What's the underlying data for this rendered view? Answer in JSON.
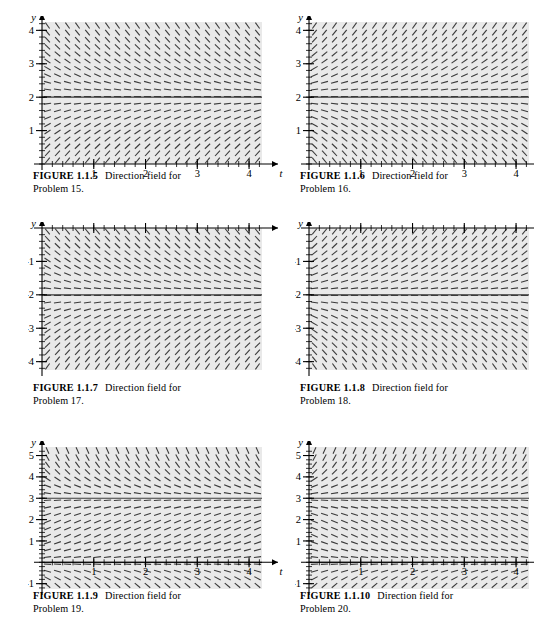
{
  "page": {
    "background_color": "#ffffff",
    "panel_color": "#e9e9e9",
    "ink_color": "#3a3a3a",
    "axis_color": "#000000"
  },
  "figures": [
    {
      "id": "figure-1-1-5",
      "label": "FIGURE 1.1.5",
      "description": "Direction field for",
      "caption_line2": "Problem 15.",
      "axis": {
        "x_label": "t",
        "y_label": "y",
        "x_ticks": [
          "1",
          "2",
          "3",
          "4"
        ],
        "y_ticks": [
          "1",
          "2",
          "3",
          "4"
        ],
        "xlim": [
          0,
          4.25
        ],
        "ylim": [
          0,
          4.25
        ]
      },
      "chart_data": {
        "type": "slope-field",
        "title": "Direction field for Problem 15",
        "xlabel": "t",
        "ylabel": "y",
        "xlim": [
          0,
          4.25
        ],
        "ylim": [
          0,
          4.25
        ],
        "x_ticks": [
          1,
          2,
          3,
          4
        ],
        "y_ticks": [
          1,
          2,
          3,
          4
        ],
        "equilibria": [
          2
        ],
        "equilibrium_stability": "stable",
        "slope_rule": "dy/dt = k*(2 - y), converging toward y = 2",
        "k": 1.0,
        "grid": false,
        "legend": "none"
      }
    },
    {
      "id": "figure-1-1-6",
      "label": "FIGURE 1.1.6",
      "description": "Direction field for",
      "caption_line2": "Problem 16.",
      "axis": {
        "x_label": "t",
        "y_label": "y",
        "x_ticks": [
          "1",
          "2",
          "3",
          "4"
        ],
        "y_ticks": [
          "1",
          "2",
          "3",
          "4"
        ],
        "xlim": [
          0,
          4.25
        ],
        "ylim": [
          0,
          4.25
        ]
      },
      "chart_data": {
        "type": "slope-field",
        "title": "Direction field for Problem 16",
        "xlabel": "t",
        "ylabel": "y",
        "xlim": [
          0,
          4.25
        ],
        "ylim": [
          0,
          4.25
        ],
        "x_ticks": [
          1,
          2,
          3,
          4
        ],
        "y_ticks": [
          1,
          2,
          3,
          4
        ],
        "equilibria": [
          2
        ],
        "equilibrium_stability": "unstable",
        "slope_rule": "dy/dt = k*(y - 2), diverging away from y = 2",
        "k": 1.0,
        "grid": false,
        "legend": "none"
      }
    },
    {
      "id": "figure-1-1-7",
      "label": "FIGURE 1.1.7",
      "description": "Direction field for",
      "caption_line2": "Problem 17.",
      "axis": {
        "x_label": "t",
        "y_label": "y",
        "x_ticks": [
          "1",
          "2",
          "3",
          "4"
        ],
        "y_ticks": [
          "-1",
          "-2",
          "-3",
          "-4"
        ],
        "xlim": [
          0,
          4.25
        ],
        "ylim": [
          -4.25,
          0
        ]
      },
      "chart_data": {
        "type": "slope-field",
        "title": "Direction field for Problem 17",
        "xlabel": "t",
        "ylabel": "y",
        "xlim": [
          0,
          4.25
        ],
        "ylim": [
          -4.25,
          0
        ],
        "x_ticks": [
          1,
          2,
          3,
          4
        ],
        "y_ticks": [
          -1,
          -2,
          -3,
          -4
        ],
        "equilibria": [
          -2
        ],
        "equilibrium_stability": "stable",
        "slope_rule": "dy/dt = k*(-2 - y), converging toward y = -2",
        "k": 1.0,
        "grid": false,
        "legend": "none"
      }
    },
    {
      "id": "figure-1-1-8",
      "label": "FIGURE 1.1.8",
      "description": "Direction field for",
      "caption_line2": "Problem 18.",
      "axis": {
        "x_label": "t",
        "y_label": "y",
        "x_ticks": [
          "1",
          "2",
          "3",
          "4"
        ],
        "y_ticks": [
          "-1",
          "-2",
          "-3",
          "-4"
        ],
        "xlim": [
          0,
          4.25
        ],
        "ylim": [
          -4.25,
          0
        ]
      },
      "chart_data": {
        "type": "slope-field",
        "title": "Direction field for Problem 18",
        "xlabel": "t",
        "ylabel": "y",
        "xlim": [
          0,
          4.25
        ],
        "ylim": [
          -4.25,
          0
        ],
        "x_ticks": [
          1,
          2,
          3,
          4
        ],
        "y_ticks": [
          -1,
          -2,
          -3,
          -4
        ],
        "equilibria": [
          -2
        ],
        "equilibrium_stability": "unstable",
        "slope_rule": "dy/dt = k*(y + 2), diverging away from y = -2",
        "k": 1.0,
        "grid": false,
        "legend": "none"
      }
    },
    {
      "id": "figure-1-1-9",
      "label": "FIGURE 1.1.9",
      "description": "Direction field for",
      "caption_line2": "Problem 19.",
      "axis": {
        "x_label": "t",
        "y_label": "y",
        "x_ticks": [
          "1",
          "2",
          "3",
          "4"
        ],
        "y_ticks": [
          "-1",
          "1",
          "2",
          "3",
          "4",
          "5"
        ],
        "xlim": [
          0,
          4.25
        ],
        "ylim": [
          -1.25,
          5.4
        ]
      },
      "chart_data": {
        "type": "slope-field",
        "title": "Direction field for Problem 19",
        "xlabel": "t",
        "ylabel": "y",
        "xlim": [
          0,
          4.25
        ],
        "ylim": [
          -1.25,
          5.4
        ],
        "x_ticks": [
          1,
          2,
          3,
          4
        ],
        "y_ticks": [
          -1,
          1,
          2,
          3,
          4,
          5
        ],
        "equilibria": [
          0,
          3
        ],
        "equilibrium_stability": "y=3 semi-stable / y=0 equilibrium",
        "slope_rule": "dy/dt = k*y*(3 - y)/3, steep near y=5 and below y=0",
        "k": 1.4,
        "grid": false,
        "legend": "none"
      }
    },
    {
      "id": "figure-1-1-10",
      "label": "FIGURE 1.1.10",
      "description": "Direction field for",
      "caption_line2": "Problem 20.",
      "axis": {
        "x_label": "t",
        "y_label": "y",
        "x_ticks": [
          "1",
          "2",
          "3",
          "4"
        ],
        "y_ticks": [
          "-1",
          "1",
          "2",
          "3",
          "4",
          "5"
        ],
        "xlim": [
          0,
          4.25
        ],
        "ylim": [
          -1.25,
          5.4
        ]
      },
      "chart_data": {
        "type": "slope-field",
        "title": "Direction field for Problem 20",
        "xlabel": "t",
        "ylabel": "y",
        "xlim": [
          0,
          4.25
        ],
        "ylim": [
          -1.25,
          5.4
        ],
        "x_ticks": [
          1,
          2,
          3,
          4
        ],
        "y_ticks": [
          -1,
          1,
          2,
          3,
          4,
          5
        ],
        "equilibria": [
          0,
          3
        ],
        "equilibrium_stability": "y=3 attracting from below, y=0 repelling",
        "slope_rule": "dy/dt = -k*y*(3 - y)/3, slopes reversed from Problem 19",
        "k": 1.4,
        "grid": false,
        "legend": "none"
      }
    }
  ]
}
